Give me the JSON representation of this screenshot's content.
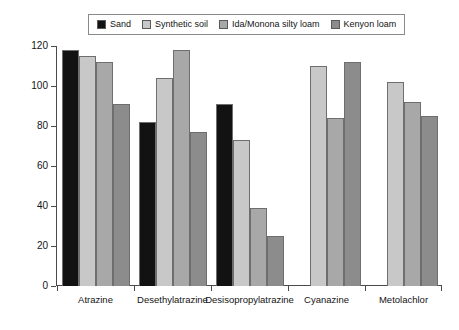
{
  "chart_data": {
    "type": "bar",
    "title": "",
    "xlabel": "",
    "ylabel": "Recovery (%)",
    "ylim": [
      0,
      120
    ],
    "yticks": [
      0,
      20,
      40,
      60,
      80,
      100,
      120
    ],
    "grid": false,
    "legend_position": "top-center",
    "categories": [
      "Atrazine",
      "Desethylatrazine",
      "Desisopropylatrazine",
      "Cyanazine",
      "Metolachlor"
    ],
    "series": [
      {
        "name": "Sand",
        "color": "#121212",
        "values": [
          118,
          82,
          91,
          null,
          null
        ]
      },
      {
        "name": "Synthetic soil",
        "color": "#c8c8c8",
        "values": [
          115,
          104,
          73,
          110,
          102
        ]
      },
      {
        "name": "Ida/Monona silty loam",
        "color": "#a8a8a8",
        "values": [
          112,
          118,
          39,
          84,
          92
        ]
      },
      {
        "name": "Kenyon loam",
        "color": "#8c8c8c",
        "values": [
          91,
          77,
          25,
          112,
          85
        ]
      }
    ]
  },
  "legend": {
    "entries": [
      {
        "label": "Sand"
      },
      {
        "label": "Synthetic soil"
      },
      {
        "label": "Ida/Monona silty loam"
      },
      {
        "label": "Kenyon loam"
      }
    ]
  },
  "axes": {
    "y_label": "Recovery (%)",
    "y_ticks": [
      "120",
      "100",
      "80",
      "60",
      "40",
      "20",
      "0"
    ],
    "x_labels": [
      "Atrazine",
      "Desethylatrazine",
      "Desisopropylatrazine",
      "Cyanazine",
      "Metolachlor"
    ]
  }
}
